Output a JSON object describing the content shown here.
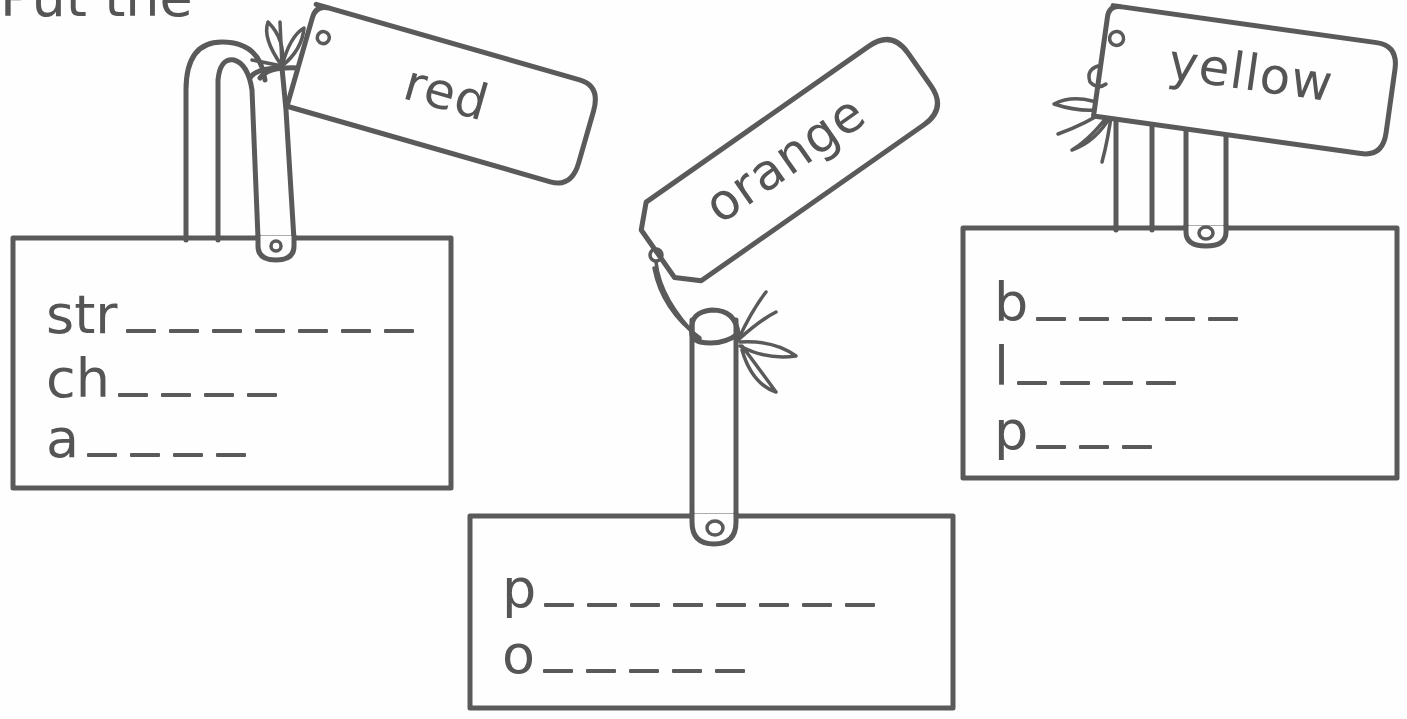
{
  "worksheet": {
    "heading_partial": "Put the",
    "cards": [
      {
        "tag": "red",
        "rows": [
          {
            "prefix": "str",
            "blanks": 7
          },
          {
            "prefix": "ch",
            "blanks": 4
          },
          {
            "prefix": "a",
            "blanks": 4
          }
        ]
      },
      {
        "tag": "orange",
        "rows": [
          {
            "prefix": "p",
            "blanks": 8
          },
          {
            "prefix": "o",
            "blanks": 5
          }
        ]
      },
      {
        "tag": "yellow",
        "rows": [
          {
            "prefix": "b",
            "blanks": 5
          },
          {
            "prefix": "l",
            "blanks": 4
          },
          {
            "prefix": "p",
            "blanks": 3
          }
        ]
      }
    ]
  },
  "labels": {
    "red": "red",
    "orange": "orange",
    "yellow": "yellow",
    "r1p": "str",
    "r2p": "ch",
    "r3p": "a",
    "o1p": "p",
    "o2p": "o",
    "y1p": "b",
    "y2p": "l",
    "y3p": "p"
  }
}
